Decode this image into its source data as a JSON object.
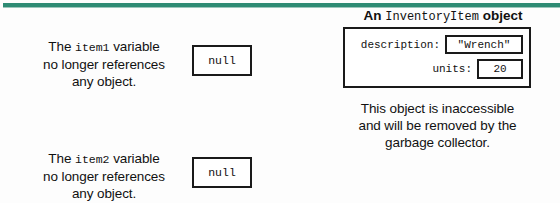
{
  "figure": {
    "accent_color": "#2e8b74",
    "background": "#fdfdfd",
    "text_color": "#111111",
    "border_color": "#1a1a1a"
  },
  "left_blocks": [
    {
      "line1_prefix": "The ",
      "line1_code": "item1",
      "line1_suffix": " variable",
      "line2": "no longer references",
      "line3": "any object.",
      "value_box": "null"
    },
    {
      "line1_prefix": "The ",
      "line1_code": "item2",
      "line1_suffix": " variable",
      "line2": "no longer references",
      "line3": "any object.",
      "value_box": "null"
    }
  ],
  "object_panel": {
    "title_prefix": "An ",
    "title_code": "InventoryItem",
    "title_suffix": " object",
    "fields": [
      {
        "label": "description:",
        "value": "\"Wrench\""
      },
      {
        "label": "units:",
        "value": "20"
      }
    ],
    "caption": {
      "line1": "This object is inaccessible",
      "line2": "and will be removed by the",
      "line3": "garbage collector."
    }
  }
}
